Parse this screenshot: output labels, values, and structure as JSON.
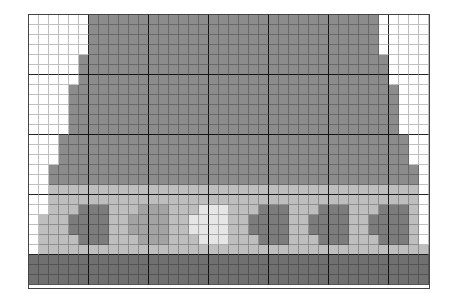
{
  "palette": {
    "W": "#ffffff",
    "D": "#8c8c8c",
    "M": "#a3a3a3",
    "L": "#bebebe",
    "C": "#7c7c7c",
    "P": "#e6e6e6",
    "B": "#707070"
  },
  "grid": {
    "columns": 40,
    "major_every": 6,
    "rows": [
      "WWWWWWDDDDDDDDDDDDDDDDDDDDDDDDDDDDDWWWWW",
      "WWWWWWDDDDDDDDDDDDDDDDDDDDDDDDDDDDDWWWWW",
      "WWWWWWDDDDDDDDDDDDDDDDDDDDDDDDDDDDDWWWWW",
      "WWWWWWDDDDDDDDDDDDDDDDDDDDDDDDDDDDDWWWWW",
      "WWWWWDDDDDDDDDDDDDDDDDDDDDDDDDDDDDDDWWWW",
      "WWWWWDDDDDDDDDDDDDDDDDDDDDDDDDDDDDDDWWWW",
      "WWWWWDDDDDDDDDDDDDDDDDDDDDDDDDDDDDDDWWWW",
      "WWWWDDDDDDDDDDDDDDDDDDDDDDDDDDDDDDDDDWWW",
      "WWWWDDDDDDDDDDDDDDDDDDDDDDDDDDDDDDDDDWWW",
      "WWWWDDDDDDDDDDDDDDDDDDDDDDDDDDDDDDDDDWWW",
      "WWWWDDDDDDDDDDDDDDDDDDDDDDDDDDDDDDDDDWWW",
      "WWWWDDDDDDDDDDDDDDDDDDDDDDDDDDDDDDDDDWWW",
      "WWWDDDDDDDDDDDDDDDDDDDDDDDDDDDDDDDDDDDWW",
      "WWWDDDDDDDDDDDDDDDDDDDDDDDDDDDDDDDDDDDWW",
      "WWWDDDDDDDDDDDDDDDDDDDDDDDDDDDDDDDDDDDWW",
      "WWDDDDDDDDDDDDDDDDDDDDDDDDDDDDDDDDDDDDDW",
      "WWDDDDDDDDDDDDDDDDDDDDDDDDDDDDDDDDDDDDDW",
      "WWLLLLLLLLLLLLLLLLLLLLLLLLLLLLLLLLLLLLLW",
      "WWLLLLLLLLLLLLLLLLLLLLLLLLLLLLLLLLLLLLLW",
      "WWLLLCCCLLLMMMLLLPPPLLLCCCLLLCCCLLLCCCLW",
      "WLLLCCCCLLMMMMLLPPPPLLCCCCLLCCCCLLCCCCLW",
      "WLLLCCCCLLMMMMLLPPPPLLCCCCLLCCCCLLCCCCLW",
      "WLLLLCCCLLLMMMLLLPPPLLLCCCLLLCCCLLLCCCLW",
      "WLLLLLLLLLLLLLLLLLLLLLLLLLLLLLLLLLLLLLLL",
      "BBBBBBBBBBBBBBBBBBBBBBBBBBBBBBBBBBBBBBBB",
      "BBBBBBBBBBBBBBBBBBBBBBBBBBBBBBBBBBBBBBBB",
      "BBBBBBBBBBBBBBBBBBBBBBBBBBBBBBBBBBBBBBBB"
    ]
  }
}
